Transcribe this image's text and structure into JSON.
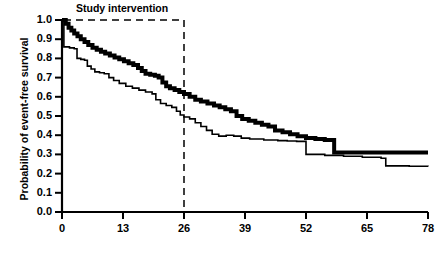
{
  "chart_data": {
    "type": "line",
    "title": "",
    "xlabel": "",
    "ylabel": "Probability of event-free survival",
    "xlim": [
      0,
      78
    ],
    "ylim": [
      0.0,
      1.0
    ],
    "grid": false,
    "legend_position": "none",
    "x_ticks": [
      0,
      13,
      26,
      39,
      52,
      65,
      78
    ],
    "x_tick_labels": [
      "0",
      "13",
      "26",
      "39",
      "52",
      "65",
      "78"
    ],
    "y_ticks": [
      0.0,
      0.1,
      0.2,
      0.3,
      0.4,
      0.5,
      0.6,
      0.7,
      0.8,
      0.9,
      1.0
    ],
    "y_tick_labels": [
      "0.0",
      "0.1",
      "0.2",
      "0.3",
      "0.4",
      "0.5",
      "0.6",
      "0.7",
      "0.8",
      "0.9",
      "1.0"
    ],
    "annotations": [
      {
        "name": "study-intervention",
        "text": "Study intervention",
        "type": "bracket",
        "x_start": 0,
        "x_end": 26,
        "y": 1.0,
        "style": "dashed"
      }
    ],
    "series": [
      {
        "name": "thick-curve",
        "label": "",
        "style": "step",
        "line_width": 4,
        "color": "#000000",
        "final_value": 0.31,
        "points": [
          [
            0,
            1.0
          ],
          [
            0.8,
            0.98
          ],
          [
            1.4,
            0.96
          ],
          [
            2.0,
            0.945
          ],
          [
            2.6,
            0.93
          ],
          [
            3.3,
            0.915
          ],
          [
            4.0,
            0.9
          ],
          [
            4.8,
            0.885
          ],
          [
            5.6,
            0.87
          ],
          [
            6.5,
            0.855
          ],
          [
            7.4,
            0.845
          ],
          [
            8.3,
            0.835
          ],
          [
            9.2,
            0.825
          ],
          [
            10.2,
            0.815
          ],
          [
            11.2,
            0.805
          ],
          [
            12.2,
            0.795
          ],
          [
            13.2,
            0.785
          ],
          [
            14.2,
            0.775
          ],
          [
            15.2,
            0.765
          ],
          [
            16.2,
            0.75
          ],
          [
            17.0,
            0.735
          ],
          [
            17.8,
            0.72
          ],
          [
            18.8,
            0.715
          ],
          [
            19.8,
            0.71
          ],
          [
            20.6,
            0.7
          ],
          [
            21.4,
            0.675
          ],
          [
            22.2,
            0.655
          ],
          [
            23.0,
            0.645
          ],
          [
            24.0,
            0.635
          ],
          [
            25.0,
            0.625
          ],
          [
            26.0,
            0.615
          ],
          [
            27.2,
            0.6
          ],
          [
            28.4,
            0.585
          ],
          [
            29.6,
            0.575
          ],
          [
            31.0,
            0.565
          ],
          [
            32.4,
            0.555
          ],
          [
            33.6,
            0.545
          ],
          [
            34.8,
            0.535
          ],
          [
            36.0,
            0.525
          ],
          [
            37.2,
            0.5
          ],
          [
            38.4,
            0.485
          ],
          [
            39.8,
            0.475
          ],
          [
            41.2,
            0.465
          ],
          [
            42.6,
            0.455
          ],
          [
            44.0,
            0.445
          ],
          [
            45.4,
            0.425
          ],
          [
            47.0,
            0.415
          ],
          [
            48.6,
            0.405
          ],
          [
            50.2,
            0.395
          ],
          [
            52.0,
            0.385
          ],
          [
            54.0,
            0.38
          ],
          [
            56.0,
            0.375
          ],
          [
            58.0,
            0.31
          ],
          [
            78,
            0.31
          ]
        ]
      },
      {
        "name": "thin-curve",
        "label": "",
        "style": "step",
        "line_width": 1.6,
        "color": "#000000",
        "final_value": 0.24,
        "points": [
          [
            0,
            1.0
          ],
          [
            0.4,
            0.86
          ],
          [
            1.6,
            0.855
          ],
          [
            2.6,
            0.85
          ],
          [
            3.2,
            0.8
          ],
          [
            4.0,
            0.795
          ],
          [
            4.8,
            0.79
          ],
          [
            5.4,
            0.76
          ],
          [
            6.2,
            0.745
          ],
          [
            7.0,
            0.73
          ],
          [
            8.0,
            0.725
          ],
          [
            9.0,
            0.72
          ],
          [
            10.0,
            0.7
          ],
          [
            11.0,
            0.685
          ],
          [
            12.2,
            0.67
          ],
          [
            13.6,
            0.655
          ],
          [
            15.0,
            0.645
          ],
          [
            16.4,
            0.635
          ],
          [
            17.8,
            0.625
          ],
          [
            19.2,
            0.615
          ],
          [
            20.0,
            0.585
          ],
          [
            21.0,
            0.565
          ],
          [
            22.2,
            0.555
          ],
          [
            23.4,
            0.545
          ],
          [
            24.4,
            0.525
          ],
          [
            25.2,
            0.505
          ],
          [
            26.0,
            0.495
          ],
          [
            27.2,
            0.485
          ],
          [
            28.4,
            0.465
          ],
          [
            29.6,
            0.445
          ],
          [
            30.8,
            0.425
          ],
          [
            32.0,
            0.405
          ],
          [
            33.4,
            0.395
          ],
          [
            35.0,
            0.4
          ],
          [
            36.6,
            0.395
          ],
          [
            38.2,
            0.385
          ],
          [
            40.0,
            0.38
          ],
          [
            43.0,
            0.375
          ],
          [
            46.0,
            0.372
          ],
          [
            48.0,
            0.37
          ],
          [
            50.0,
            0.368
          ],
          [
            52.0,
            0.3
          ],
          [
            56.0,
            0.295
          ],
          [
            60.0,
            0.29
          ],
          [
            64.0,
            0.285
          ],
          [
            68.0,
            0.28
          ],
          [
            69.0,
            0.24
          ],
          [
            74.0,
            0.238
          ],
          [
            78,
            0.237
          ]
        ]
      }
    ]
  },
  "axes": {
    "y_title": "Probability of event-free survival"
  }
}
